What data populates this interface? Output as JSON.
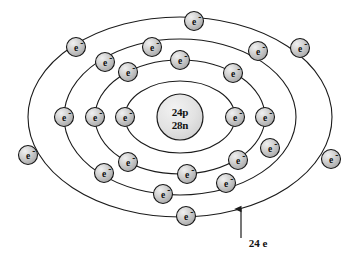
{
  "figure": {
    "kind": "bohr-atomic-model",
    "background_color": "#ffffff",
    "line_color": "#1b1b1b",
    "electron_fill": "#c9c9c9",
    "nucleus_fill": "#e3e3e3"
  },
  "nucleus": {
    "protons_label": "24p",
    "neutrons_label": "28n",
    "center_x": 180,
    "center_y": 117,
    "radius": 23
  },
  "orbits": [
    {
      "name": "shell-1",
      "rx": 55,
      "ry": 36,
      "electron_count": 2
    },
    {
      "name": "shell-2",
      "rx": 85,
      "ry": 57,
      "electron_count": 8
    },
    {
      "name": "shell-3",
      "rx": 116,
      "ry": 78,
      "electron_count": 8
    },
    {
      "name": "shell-4",
      "rx": 152,
      "ry": 100,
      "electron_count": 6
    }
  ],
  "electron_label": "e",
  "electron_charge_sign": "-",
  "electrons": [
    {
      "shell": 1,
      "cx": 125,
      "cy": 117
    },
    {
      "shell": 1,
      "cx": 235,
      "cy": 117
    },
    {
      "shell": 2,
      "cx": 180,
      "cy": 60
    },
    {
      "shell": 2,
      "cx": 128,
      "cy": 72
    },
    {
      "shell": 2,
      "cx": 95,
      "cy": 117
    },
    {
      "shell": 2,
      "cx": 128,
      "cy": 162
    },
    {
      "shell": 2,
      "cx": 187,
      "cy": 174
    },
    {
      "shell": 2,
      "cx": 238,
      "cy": 160
    },
    {
      "shell": 2,
      "cx": 265,
      "cy": 117
    },
    {
      "shell": 2,
      "cx": 233,
      "cy": 73
    },
    {
      "shell": 3,
      "cx": 152,
      "cy": 47
    },
    {
      "shell": 3,
      "cx": 105,
      "cy": 62
    },
    {
      "shell": 3,
      "cx": 64,
      "cy": 117
    },
    {
      "shell": 3,
      "cx": 104,
      "cy": 173
    },
    {
      "shell": 3,
      "cx": 163,
      "cy": 194
    },
    {
      "shell": 3,
      "cx": 226,
      "cy": 183
    },
    {
      "shell": 3,
      "cx": 270,
      "cy": 148
    },
    {
      "shell": 3,
      "cx": 258,
      "cy": 51
    },
    {
      "shell": 4,
      "cx": 194,
      "cy": 21
    },
    {
      "shell": 4,
      "cx": 76,
      "cy": 47
    },
    {
      "shell": 4,
      "cx": 300,
      "cy": 48
    },
    {
      "shell": 4,
      "cx": 28,
      "cy": 155
    },
    {
      "shell": 4,
      "cx": 331,
      "cy": 159
    },
    {
      "shell": 4,
      "cx": 186,
      "cy": 216
    }
  ],
  "annotation": {
    "label": "24 e",
    "label_x": 258,
    "label_y": 247,
    "arrow_x": 241,
    "arrow_tail_y": 238,
    "arrow_head_y": 209
  }
}
